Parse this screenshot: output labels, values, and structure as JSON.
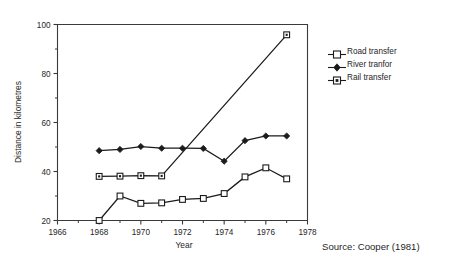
{
  "chart_data": {
    "type": "line",
    "title": "",
    "xlabel": "Year",
    "ylabel": "Distance in kilometres",
    "xlim": [
      1966,
      1978
    ],
    "ylim": [
      20,
      100
    ],
    "xticks": [
      1966,
      1968,
      1970,
      1972,
      1974,
      1976,
      1978
    ],
    "xtick_labels": [
      "1966",
      "1968",
      "1970",
      "1972",
      "1974",
      "1976",
      "1978"
    ],
    "xminor_ticks": [
      1967,
      1969,
      1971,
      1973,
      1975,
      1977
    ],
    "yticks": [
      20,
      40,
      60,
      80,
      100
    ],
    "ytick_labels": [
      "20",
      "40",
      "60",
      "80",
      "100"
    ],
    "yminor_ticks": [
      30,
      50,
      70,
      90
    ],
    "grid": false,
    "legend_position": "right-outside",
    "series": [
      {
        "name": "Road transfer",
        "marker": "open-square",
        "x": [
          1968,
          1969,
          1970,
          1971,
          1972,
          1973,
          1974,
          1975,
          1976,
          1977
        ],
        "values": [
          20.0,
          30.0,
          27.0,
          27.2,
          28.6,
          29.0,
          31.0,
          37.8,
          41.5,
          37.0
        ]
      },
      {
        "name": "River tranfor",
        "marker": "filled-diamond",
        "x": [
          1968,
          1969,
          1970,
          1971,
          1972,
          1973,
          1974,
          1975,
          1976,
          1977
        ],
        "values": [
          48.5,
          49.0,
          50.2,
          49.5,
          49.5,
          49.4,
          44.2,
          52.6,
          54.5,
          54.5
        ]
      },
      {
        "name": "Rail transfer",
        "marker": "dotted-square",
        "x": [
          1968,
          1969,
          1970,
          1971,
          1977
        ],
        "values": [
          38.0,
          38.1,
          38.3,
          38.2,
          95.8
        ]
      }
    ]
  },
  "legend": {
    "items": [
      {
        "label": "Road transfer",
        "marker": "open-square"
      },
      {
        "label": "River tranfor",
        "marker": "filled-diamond"
      },
      {
        "label": "Rail transfer",
        "marker": "dotted-square"
      }
    ]
  },
  "caption": {
    "source": "Source: Cooper (1981)"
  }
}
